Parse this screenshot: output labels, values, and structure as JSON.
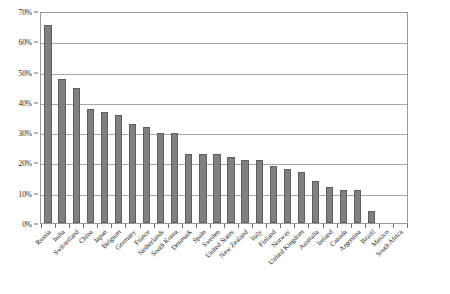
{
  "chart_data": {
    "type": "bar",
    "title": "",
    "subtitle": "",
    "xlabel": "",
    "ylabel": "",
    "ylim": [
      0,
      70
    ],
    "y_tick_step": 10,
    "y_tick_labels": [
      "0%",
      "10%",
      "20%",
      "30%",
      "40%",
      "50%",
      "60%",
      "70%"
    ],
    "y_tick_values": [
      0,
      10,
      20,
      30,
      40,
      50,
      60,
      70
    ],
    "grid": true,
    "legend": false,
    "bar_color": "#808080",
    "bar_edge_color": "#5e5e5e",
    "plot_border_color": "#9a9a9a",
    "gridline_color": "#a8a8a8",
    "categories": [
      "Russia",
      "India",
      "Switzerland",
      "China",
      "Japan",
      "Belgium",
      "Germany",
      "France",
      "Netherlands",
      "South Korea",
      "Denmark",
      "Spain",
      "Sweden",
      "United States",
      "New Zealand",
      "Italy",
      "Finland",
      "Norway",
      "United Kingdom",
      "Australia",
      "Ireland",
      "Canada",
      "Argentina",
      "Brazil",
      "Mexico",
      "South Africa"
    ],
    "values": [
      66,
      48,
      45,
      38,
      37,
      36,
      33,
      32,
      30,
      30,
      23,
      23,
      23,
      22,
      21,
      21,
      19,
      18,
      17,
      14,
      12,
      11,
      11,
      4,
      0,
      0
    ]
  }
}
